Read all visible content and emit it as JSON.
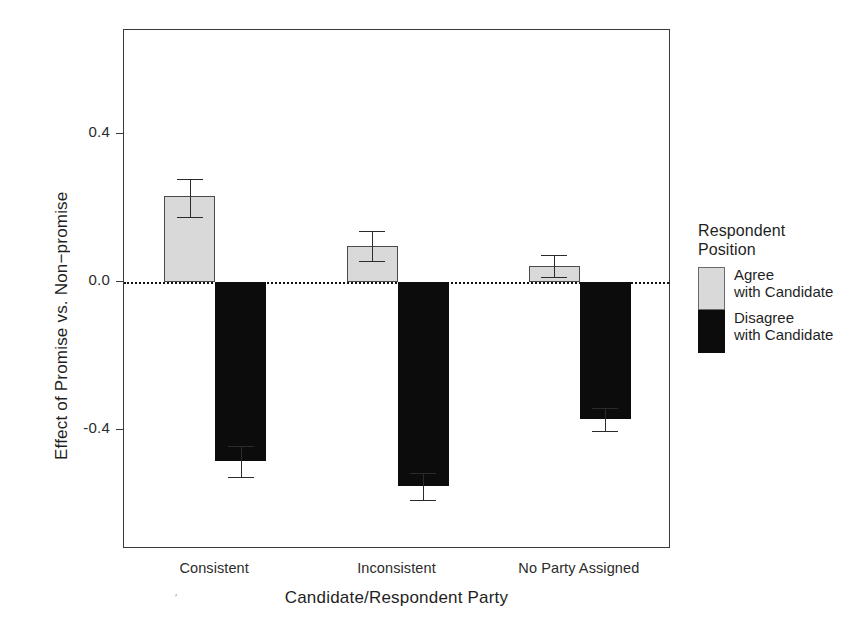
{
  "chart_data": {
    "type": "bar",
    "title": "",
    "subtitle": "",
    "xlabel": "Candidate/Respondent Party",
    "ylabel": "Effect of Promise vs. Non−promise",
    "categories": [
      "Consistent",
      "Inconsistent",
      "No Party Assigned"
    ],
    "ylim": [
      -0.72,
      0.68
    ],
    "yticks": [
      0.4,
      0.0,
      -0.4
    ],
    "ytick_labels": [
      "0.4",
      "0.0",
      "-0.4"
    ],
    "grid": false,
    "zero_reference_line": 0.0,
    "legend": {
      "title_line1": "Respondent",
      "title_line2": "Position",
      "position": "right",
      "entries": [
        {
          "label_line1": "Agree",
          "label_line2": "with Candidate",
          "color": "#d9d9d9"
        },
        {
          "label_line1": "Disagree",
          "label_line2": "with Candidate",
          "color": "#0c0c0c"
        }
      ]
    },
    "series": [
      {
        "name": "Agree with Candidate",
        "color": "#d9d9d9",
        "values": [
          0.231,
          0.098,
          0.044
        ],
        "error_low": [
          0.175,
          0.056,
          0.015
        ],
        "error_high": [
          0.278,
          0.139,
          0.074
        ]
      },
      {
        "name": "Disagree with Candidate",
        "color": "#0c0c0c",
        "values": [
          -0.483,
          -0.551,
          -0.37
        ],
        "error_low": [
          -0.527,
          -0.587,
          -0.403
        ],
        "error_high": [
          -0.441,
          -0.516,
          -0.34
        ]
      }
    ]
  },
  "axis": {
    "ytick_labels": [
      "0.4",
      "0.0",
      "-0.4"
    ],
    "xtick_labels": [
      "Consistent",
      "Inconsistent",
      "No Party Assigned"
    ],
    "xaxis_title": "Candidate/Respondent Party",
    "yaxis_title": "Effect of Promise vs. Non−promise"
  },
  "legend": {
    "title_line1": "Respondent",
    "title_line2": "Position",
    "agree_line1": "Agree",
    "agree_line2": "with Candidate",
    "disagree_line1": "Disagree",
    "disagree_line2": "with Candidate"
  },
  "artifacts": {
    "scan_mark": "′"
  }
}
